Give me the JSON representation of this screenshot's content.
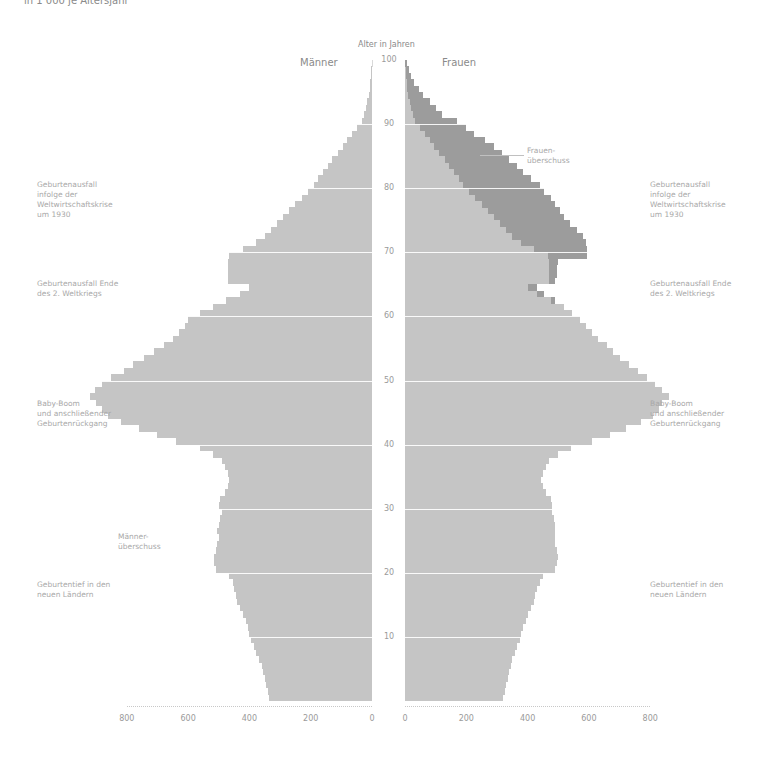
{
  "header": {
    "subtitle": "in 1 000 je Altersjahr",
    "axis_title": "Alter in Jahren",
    "left_title": "Männer",
    "right_title": "Frauen"
  },
  "annotations": {
    "left": [
      {
        "text": "Geburtenausfall\ninfolge der\nWeltwirtschaftskrise\num 1930",
        "y": 180
      },
      {
        "text": "Geburtenausfall Ende\ndes 2. Weltkriegs",
        "y": 279
      },
      {
        "text": "Baby-Boom\nund anschließender\nGeburtenrückgang",
        "y": 399
      },
      {
        "text": "Männer-\nüberschuss",
        "y": 532,
        "x": 118
      },
      {
        "text": "Geburtentief in den\nneuen Ländern",
        "y": 580
      }
    ],
    "right": [
      {
        "text": "Frauen-\nüberschuss",
        "y": 146,
        "x": 527
      },
      {
        "text": "Geburtenausfall\ninfolge der\nWeltwirtschaftskrise\num 1930",
        "y": 180
      },
      {
        "text": "Geburtenausfall Ende\ndes 2. Weltkriegs",
        "y": 279
      },
      {
        "text": "Baby-Boom\nund anschließender\nGeburtenrückgang",
        "y": 399
      },
      {
        "text": "Geburtentief in den\nneuen Ländern",
        "y": 580
      }
    ]
  },
  "colors": {
    "bar": "#d9d9d9",
    "surplus": "#b3b3b3",
    "text": "#9a9a9a"
  },
  "chart_data": {
    "type": "bar",
    "subtype": "population-pyramid",
    "subtitle": "in 1 000 je Altersjahr",
    "ylabel": "Alter in Jahren",
    "xlabel": "",
    "series_labels": [
      "Männer",
      "Frauen"
    ],
    "age_ticks": [
      10,
      20,
      30,
      40,
      50,
      60,
      70,
      80,
      90,
      100
    ],
    "x_ticks_left": [
      800,
      600,
      400,
      200,
      0
    ],
    "x_ticks_right": [
      0,
      200,
      400,
      600,
      800
    ],
    "xlim": [
      0,
      800
    ],
    "ylim": [
      0,
      100
    ],
    "ages": [
      0,
      1,
      2,
      3,
      4,
      5,
      6,
      7,
      8,
      9,
      10,
      11,
      12,
      13,
      14,
      15,
      16,
      17,
      18,
      19,
      20,
      21,
      22,
      23,
      24,
      25,
      26,
      27,
      28,
      29,
      30,
      31,
      32,
      33,
      34,
      35,
      36,
      37,
      38,
      39,
      40,
      41,
      42,
      43,
      44,
      45,
      46,
      47,
      48,
      49,
      50,
      51,
      52,
      53,
      54,
      55,
      56,
      57,
      58,
      59,
      60,
      61,
      62,
      63,
      64,
      65,
      66,
      67,
      68,
      69,
      70,
      71,
      72,
      73,
      74,
      75,
      76,
      77,
      78,
      79,
      80,
      81,
      82,
      83,
      84,
      85,
      86,
      87,
      88,
      89,
      90,
      91,
      92,
      93,
      94,
      95,
      96,
      97,
      98,
      99
    ],
    "series": [
      {
        "name": "Männer",
        "values": [
          335,
          340,
          345,
          350,
          355,
          360,
          370,
          380,
          385,
          395,
          400,
          405,
          410,
          420,
          430,
          440,
          445,
          450,
          455,
          465,
          510,
          515,
          515,
          510,
          505,
          500,
          505,
          500,
          495,
          490,
          500,
          495,
          480,
          470,
          465,
          470,
          480,
          490,
          520,
          560,
          640,
          700,
          760,
          820,
          860,
          880,
          900,
          920,
          905,
          880,
          850,
          810,
          780,
          745,
          710,
          680,
          650,
          630,
          610,
          600,
          560,
          520,
          475,
          430,
          400,
          470,
          470,
          470,
          470,
          465,
          420,
          380,
          350,
          330,
          310,
          290,
          270,
          250,
          230,
          210,
          190,
          175,
          160,
          145,
          130,
          110,
          95,
          80,
          65,
          50,
          32,
          25,
          20,
          15,
          10,
          7,
          5,
          3,
          2,
          1
        ]
      },
      {
        "name": "Frauen",
        "values": [
          320,
          325,
          330,
          335,
          340,
          345,
          350,
          360,
          365,
          375,
          380,
          385,
          395,
          400,
          410,
          420,
          425,
          430,
          440,
          450,
          490,
          495,
          500,
          495,
          490,
          490,
          490,
          490,
          485,
          480,
          480,
          475,
          460,
          450,
          445,
          450,
          460,
          470,
          500,
          540,
          610,
          670,
          720,
          770,
          810,
          830,
          840,
          860,
          840,
          815,
          790,
          760,
          730,
          700,
          680,
          660,
          630,
          610,
          590,
          570,
          545,
          520,
          490,
          455,
          430,
          490,
          495,
          495,
          500,
          595,
          595,
          590,
          580,
          560,
          540,
          520,
          505,
          490,
          475,
          455,
          440,
          410,
          385,
          365,
          340,
          315,
          290,
          260,
          225,
          200,
          170,
          120,
          100,
          80,
          60,
          45,
          30,
          20,
          12,
          6
        ]
      },
      {
        "name": "Frauenüberschuss",
        "values": [
          0,
          0,
          0,
          0,
          0,
          0,
          0,
          0,
          0,
          0,
          0,
          0,
          0,
          0,
          0,
          0,
          0,
          0,
          0,
          0,
          0,
          0,
          0,
          0,
          0,
          0,
          0,
          0,
          0,
          0,
          0,
          0,
          0,
          0,
          0,
          0,
          0,
          0,
          0,
          0,
          0,
          0,
          0,
          0,
          0,
          0,
          0,
          0,
          0,
          0,
          0,
          0,
          0,
          0,
          0,
          0,
          0,
          0,
          0,
          0,
          0,
          0,
          15,
          25,
          30,
          20,
          25,
          25,
          30,
          130,
          175,
          210,
          230,
          230,
          230,
          230,
          235,
          240,
          245,
          245,
          250,
          235,
          225,
          220,
          210,
          205,
          195,
          180,
          160,
          150,
          138,
          95,
          80,
          65,
          50,
          38,
          25,
          17,
          10,
          5
        ]
      }
    ]
  }
}
